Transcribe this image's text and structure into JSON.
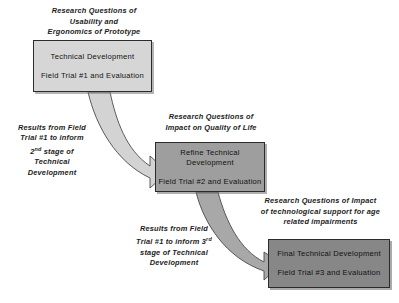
{
  "diagram": {
    "background_color": "#ffffff",
    "text_color": "#1c1c1c",
    "stages": [
      {
        "id": "stage-1",
        "heading": "Research Questions of\nUsability and\nErgonomics of Prototype",
        "box_line_1": "Technical Development",
        "box_line_2": "Field Trial #1 and Evaluation",
        "fill_color": "#d6d6d6",
        "border_color": "#2b2b2b"
      },
      {
        "id": "stage-2",
        "heading": "Research Questions of\nImpact on Quality of Life",
        "box_line_1": "Refine Technical\nDevelopment",
        "box_line_2": "Field Trial #2 and Evaluation",
        "fill_color": "#9e9e9e",
        "border_color": "#2b2b2b"
      },
      {
        "id": "stage-3",
        "heading": "Research Questions of Impact\nof technological support for age\nrelated impairments",
        "box_line_1": "Final Technical Development",
        "box_line_2": "Field Trial #3 and Evaluation",
        "fill_color": "#878787",
        "border_color": "#2b2b2b"
      }
    ],
    "flow_labels": [
      {
        "id": "flow-1",
        "text": "Results from Field\nTrial #1 to inform\n2",
        "superscript": "nd",
        "text_tail": " stage of\nTechnical\nDevelopment"
      },
      {
        "id": "flow-2",
        "text": "Results from Field\nTrial #1 to inform  3",
        "superscript": "rd",
        "text_tail": "\nstage of Technical\nDevelopment"
      }
    ],
    "arrows": [
      {
        "id": "arrow-1",
        "from": "stage-1",
        "to": "stage-2",
        "fill_color": "#d3d3d3",
        "stroke_color": "#4a4a4a"
      },
      {
        "id": "arrow-2",
        "from": "stage-2",
        "to": "stage-3",
        "fill_color": "#a8a8a8",
        "stroke_color": "#4a4a4a"
      }
    ]
  }
}
